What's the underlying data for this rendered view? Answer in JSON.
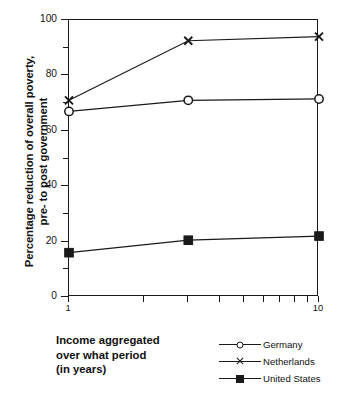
{
  "chart_data": {
    "type": "line",
    "title": "",
    "xlabel": "Income aggregated\nover what period\n(in years)",
    "ylabel": "Percentage reduction of overall poverty,\npre- to post government",
    "x": [
      1,
      3,
      10
    ],
    "xlim": [
      1,
      10
    ],
    "xscale": "log",
    "ylim": [
      0,
      100
    ],
    "yticks": [
      0,
      20,
      40,
      60,
      80,
      100
    ],
    "ytick_labels": [
      "0",
      "20",
      "40",
      "60",
      "80",
      "100"
    ],
    "yminor_ticks": [
      10,
      30,
      50,
      70,
      90
    ],
    "xtick_values": [
      1,
      2,
      3,
      4,
      5,
      6,
      7,
      8,
      9,
      10
    ],
    "xtick_labels": [
      "1",
      "",
      "",
      "",
      "",
      "",
      "",
      "",
      "",
      "10"
    ],
    "grid": false,
    "legend_position": "bottom-right",
    "series": [
      {
        "name": "Germany",
        "marker": "open-circle",
        "values": [
          67,
          71,
          71.5
        ]
      },
      {
        "name": "Netherlands",
        "marker": "cross",
        "values": [
          71,
          92.5,
          94
        ]
      },
      {
        "name": "United States",
        "marker": "filled-square",
        "values": [
          16,
          20.5,
          22
        ]
      }
    ],
    "line_color": "#1a1a1a",
    "background": "#ffffff"
  },
  "legend": {
    "entries": [
      {
        "label": "Germany",
        "marker": "open-circle"
      },
      {
        "label": "Netherlands",
        "marker": "cross"
      },
      {
        "label": "United States",
        "marker": "filled-square"
      }
    ]
  }
}
